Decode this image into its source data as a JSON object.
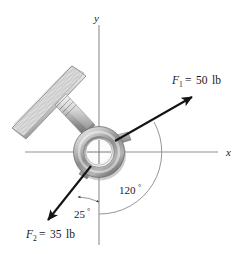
{
  "figure": {
    "background_color": "#ffffff",
    "line_color": "#1a1a1a",
    "axis_color": "#8c8c8c",
    "metal_color": "#9a9a9a",
    "wood_color": "#d9d9d9"
  },
  "axes": {
    "x_label": "x",
    "y_label": "y",
    "origin": {
      "x": 99,
      "y": 152
    },
    "x_range_px": [
      25,
      218
    ],
    "y_range_px": [
      25,
      245
    ]
  },
  "forces": [
    {
      "id": "F1",
      "name": "F",
      "subscript": "1",
      "equals": "=",
      "magnitude": "50",
      "units": "lb",
      "label": "F1 = 50 lb",
      "tail": {
        "x": 115,
        "y": 141
      },
      "tip": {
        "x": 194,
        "y": 96
      }
    },
    {
      "id": "F2",
      "name": "F",
      "subscript": "2",
      "equals": "=",
      "magnitude": "35",
      "units": "lb",
      "label": "F2 = 35 lb",
      "tail": {
        "x": 91,
        "y": 166
      },
      "tip": {
        "x": 46,
        "y": 223
      }
    }
  ],
  "angles": [
    {
      "id": "angle-120",
      "value": "120",
      "unit": "°",
      "label": "120°",
      "from": "positive-x-axis-side",
      "to": "F1-direction",
      "text_pos": {
        "x": 126,
        "y": 190
      }
    },
    {
      "id": "angle-25",
      "value": "25",
      "unit": "°",
      "label": "25°",
      "from": "negative-y-axis",
      "to": "F2-direction",
      "text_pos": {
        "x": 81,
        "y": 215
      }
    }
  ],
  "parts": [
    {
      "id": "plank",
      "name": "wooden-plank",
      "note": "inclined board with wood grain"
    },
    {
      "id": "screw",
      "name": "threaded-screw-shank"
    },
    {
      "id": "ring",
      "name": "eyebolt-ring"
    },
    {
      "id": "lug-upper-right",
      "name": "ring-lug"
    },
    {
      "id": "lug-lower-left",
      "name": "ring-lug"
    }
  ]
}
